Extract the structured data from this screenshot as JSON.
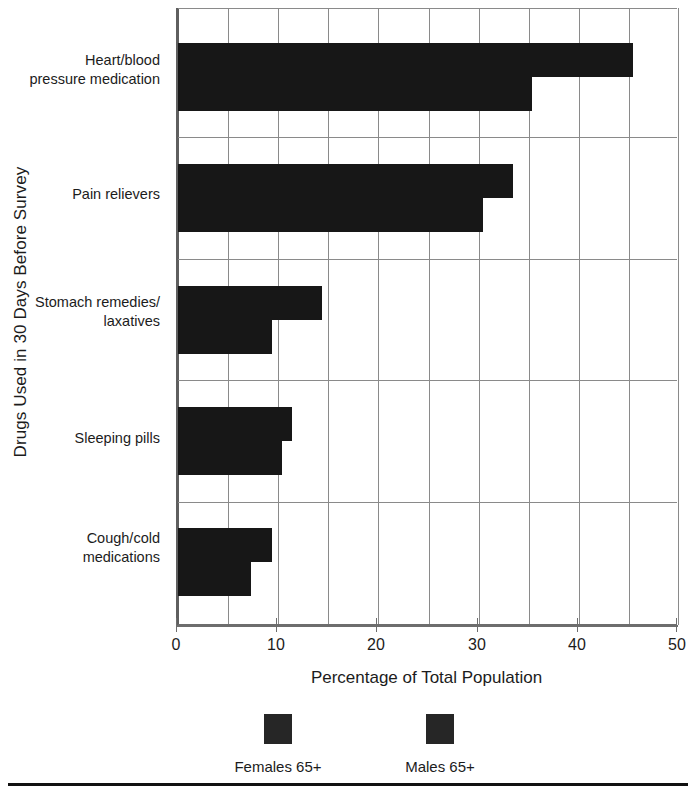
{
  "chart_data": {
    "type": "bar",
    "orientation": "horizontal",
    "title": "",
    "xlabel": "Percentage of Total Population",
    "ylabel": "Drugs Used in 30 Days Before Survey",
    "xlim": [
      0,
      50
    ],
    "xticks": [
      0,
      10,
      20,
      30,
      40,
      50
    ],
    "xtick_labels": [
      "0",
      "10",
      "20",
      "30",
      "40",
      "50"
    ],
    "minor_gridlines_every": 5,
    "grid": true,
    "legend_position": "bottom",
    "categories": [
      "Heart/blood pressure medication",
      "Pain relievers",
      "Stomach remedies/laxatives",
      "Sleeping pills",
      "Cough/cold medications"
    ],
    "category_lines": [
      [
        "Heart/blood",
        "pressure medication"
      ],
      [
        "Pain relievers"
      ],
      [
        "Stomach remedies/",
        "laxatives"
      ],
      [
        "Sleeping pills"
      ],
      [
        "Cough/cold",
        "medications"
      ]
    ],
    "series": [
      {
        "name": "Females 65+",
        "color": "#171717",
        "values": [
          45.4,
          33.4,
          14.4,
          11.4,
          9.4
        ]
      },
      {
        "name": "Males 65+",
        "color": "#171717",
        "values": [
          35.3,
          30.4,
          9.4,
          10.4,
          7.3
        ]
      }
    ]
  },
  "legend": {
    "items": [
      {
        "label": "Females 65+",
        "color": "#262626"
      },
      {
        "label": "Males 65+",
        "color": "#262626"
      }
    ]
  },
  "axis": {
    "x_title": "Percentage of Total Population",
    "y_title": "Drugs Used in 30 Days Before Survey",
    "x_tick_labels": [
      "0",
      "10",
      "20",
      "30",
      "40",
      "50"
    ]
  }
}
